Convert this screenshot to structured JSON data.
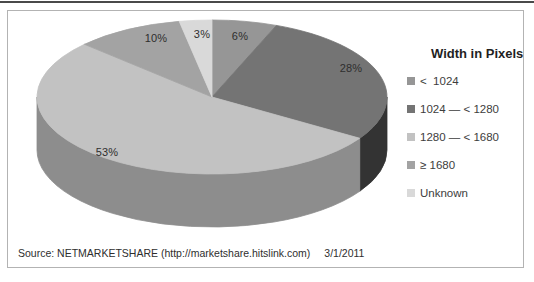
{
  "chart_data": {
    "type": "pie",
    "title": "Width in Pixels",
    "categories": [
      "<  1024",
      "1024 — < 1280",
      "1280 — < 1680",
      "≥ 1680",
      "Unknown"
    ],
    "values": [
      6,
      28,
      53,
      10,
      3
    ],
    "unit": "percent",
    "slice_labels": [
      "6%",
      "28%",
      "53%",
      "10%",
      "3%"
    ],
    "colors": [
      "#969696",
      "#747474",
      "#c2c2c2",
      "#a3a3a3",
      "#d9d9d9"
    ],
    "side_colors": [
      "#6b6b6b",
      "#333333",
      "#8d8d8d",
      "#787878",
      "#a9a9a9"
    ],
    "legend_position": "right",
    "style": "3d",
    "start_angle_deg": 0,
    "direction": "clockwise"
  },
  "footer": {
    "source": "Source: NETMARKETSHARE (http://marketshare.hitslink.com)",
    "date": "3/1/2011"
  }
}
